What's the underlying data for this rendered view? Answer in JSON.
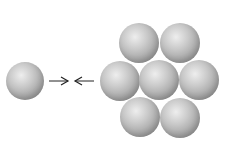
{
  "diagram": {
    "colors": {
      "sphere_light": "#eeeeee",
      "sphere_mid": "#c9c9c9",
      "sphere_dark": "#7d7d7d",
      "arrow": "#222222",
      "background": "#ffffff"
    },
    "single_sphere": {
      "cx": 25,
      "cy": 81,
      "r": 19
    },
    "arrows": [
      {
        "direction": "right",
        "x1": 49,
        "x2": 68,
        "y": 81
      },
      {
        "direction": "left",
        "x1": 94,
        "x2": 75,
        "y": 81
      }
    ],
    "cluster": [
      {
        "id": "top-left",
        "cx": 139,
        "cy": 43,
        "r": 20
      },
      {
        "id": "top-right",
        "cx": 180,
        "cy": 43,
        "r": 20
      },
      {
        "id": "mid-left",
        "cx": 120,
        "cy": 81,
        "r": 20
      },
      {
        "id": "center",
        "cx": 159,
        "cy": 80,
        "r": 20
      },
      {
        "id": "mid-right",
        "cx": 199,
        "cy": 80,
        "r": 20
      },
      {
        "id": "bottom-left",
        "cx": 140,
        "cy": 117,
        "r": 20
      },
      {
        "id": "bottom-right",
        "cx": 180,
        "cy": 118,
        "r": 20
      }
    ]
  }
}
